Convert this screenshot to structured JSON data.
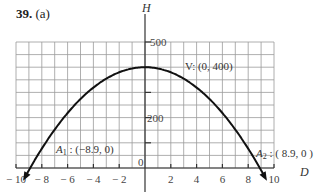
{
  "problem": {
    "number": "39.",
    "part": "(a)"
  },
  "chart_data": {
    "type": "line",
    "title": "",
    "xlabel": "D",
    "ylabel": "H",
    "xlim": [
      -10,
      10
    ],
    "ylim": [
      0,
      500
    ],
    "grid": true,
    "x_ticks": [
      -10,
      -8,
      -6,
      -4,
      -2,
      2,
      4,
      6,
      8,
      10
    ],
    "x_tick_labels": [
      "− 10",
      "− 8",
      "− 6",
      "− 4",
      "− 2",
      "2",
      "4",
      "6",
      "8",
      "10"
    ],
    "y_ticks": [
      200,
      500
    ],
    "y_tick_labels": [
      "200",
      "500"
    ],
    "origin_label": "0",
    "series": [
      {
        "name": "H = 400 − 5.05 D²",
        "x": [
          -8.9,
          -8,
          -6,
          -4,
          -2,
          0,
          2,
          4,
          6,
          8,
          8.9
        ],
        "y": [
          0,
          77,
          218,
          319,
          380,
          400,
          380,
          319,
          218,
          77,
          0
        ]
      }
    ],
    "annotations": [
      {
        "label": "V: (0, 400)",
        "x": 0,
        "y": 400
      },
      {
        "label": "A₁ : (−8.9, 0)",
        "x": -8.9,
        "y": 0
      },
      {
        "label": "A₂ : (8.9, 0)",
        "x": 8.9,
        "y": 0
      }
    ]
  },
  "labels": {
    "vertex": "V: (0, 400)",
    "a1_name": "A",
    "a1_sub": "1",
    "a1_coords": " : (−8.9, 0)",
    "a2_name": "A",
    "a2_sub": "2",
    "a2_coords": " : ( 8.9, 0 )",
    "x_axis": "D",
    "y_axis": "H",
    "origin": "0",
    "y500": "500",
    "y200": "200"
  },
  "colors": {
    "grid": "#9a9a9a",
    "curve": "#111111",
    "axis": "#333333"
  }
}
